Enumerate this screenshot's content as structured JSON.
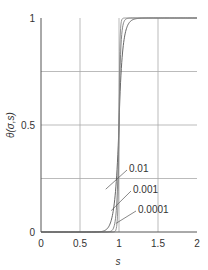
{
  "chart_data": {
    "type": "line",
    "title": "",
    "xlabel": "s",
    "ylabel": "θ(σ,s)",
    "xlim": [
      0,
      2
    ],
    "ylim": [
      0,
      1
    ],
    "x_ticks": [
      {
        "value": 0,
        "label": "0"
      },
      {
        "value": 0.5,
        "label": "0.5"
      },
      {
        "value": 1,
        "label": "1"
      },
      {
        "value": 1.5,
        "label": "1.5"
      },
      {
        "value": 2,
        "label": "2"
      }
    ],
    "y_ticks": [
      {
        "value": 0,
        "label": "0"
      },
      {
        "value": 0.5,
        "label": "0.5"
      },
      {
        "value": 1,
        "label": "1"
      }
    ],
    "grid": true,
    "grid_x": [
      0.5,
      1,
      1.5
    ],
    "grid_y": [
      0.25,
      0.5,
      0.75
    ],
    "series": [
      {
        "name": "0.01",
        "sigma": 0.01
      },
      {
        "name": "0.001",
        "sigma": 0.001
      },
      {
        "name": "0.0001",
        "sigma": 0.0001
      }
    ],
    "annotations": [
      {
        "text": "0.01",
        "points_to": {
          "x": 0.83,
          "y": 0.2
        }
      },
      {
        "text": "0.001",
        "points_to": {
          "x": 0.9,
          "y": 0.1
        }
      },
      {
        "text": "0.0001",
        "points_to": {
          "x": 0.96,
          "y": 0.04
        }
      }
    ]
  }
}
